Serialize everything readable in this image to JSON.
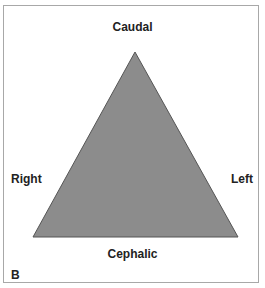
{
  "diagram": {
    "shape": "triangle",
    "fill_color": "#8c8c8c",
    "stroke_color": "#555555",
    "frame_color": "#a8a8a8",
    "labels": {
      "top": "Caudal",
      "bottom": "Cephalic",
      "left_side": "Right",
      "right_side": "Left"
    },
    "panel_label": "B"
  }
}
